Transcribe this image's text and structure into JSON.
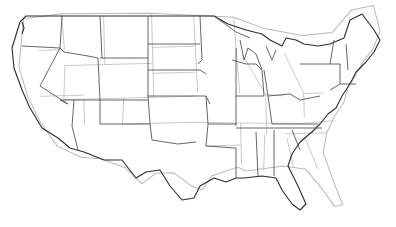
{
  "map": {
    "subject": "United States (contiguous) state boundaries",
    "layers": [
      {
        "name": "reference-outline",
        "color": "#2b2b2b"
      },
      {
        "name": "overlay-outline",
        "color": "#b8b8b8"
      }
    ],
    "background": "#ffffff"
  }
}
